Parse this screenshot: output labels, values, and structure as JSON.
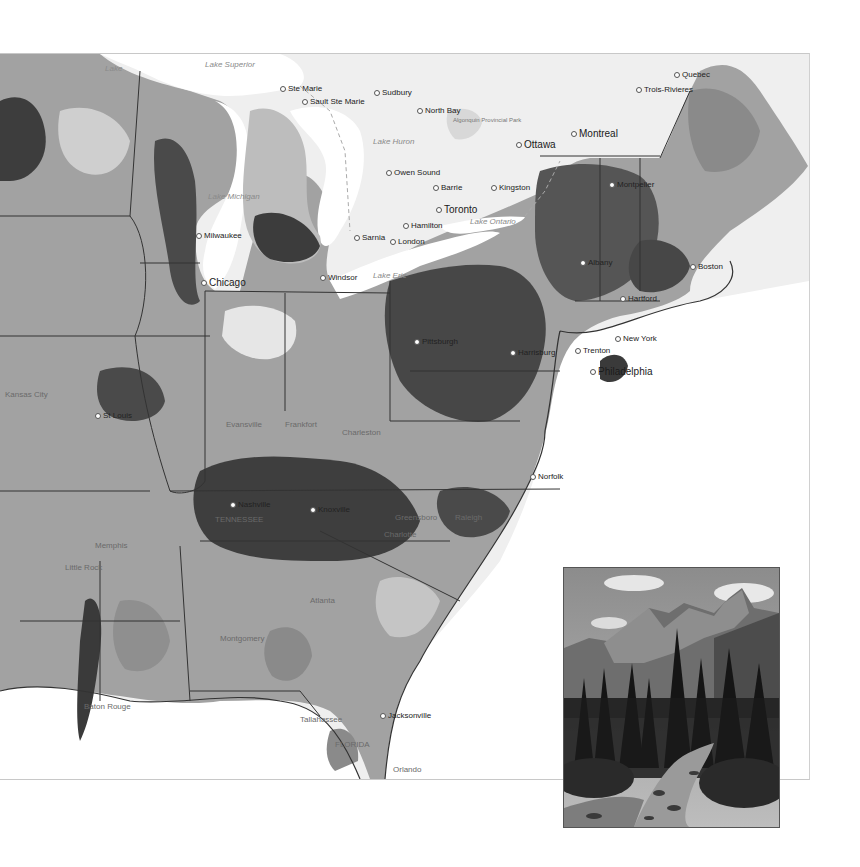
{
  "map": {
    "description": "Grayscale choropleth map of the eastern United States and southern Ontario/Quebec",
    "colors": {
      "water": "#ffffff",
      "canada_land": "#efefef",
      "light": "#c8c8c8",
      "medium": "#9a9a9a",
      "dark": "#5a5a5a",
      "darkest": "#3a3a3a",
      "border": "#333333"
    },
    "labels": [
      {
        "text": "Lake Superior",
        "x": 205,
        "y": 60,
        "type": "water"
      },
      {
        "text": "Lake",
        "x": 105,
        "y": 64,
        "type": "water"
      },
      {
        "text": "Ste Marie",
        "x": 280,
        "y": 84,
        "type": "city"
      },
      {
        "text": "Sault Ste Marie",
        "x": 302,
        "y": 97,
        "type": "city"
      },
      {
        "text": "Sudbury",
        "x": 374,
        "y": 88,
        "type": "city"
      },
      {
        "text": "North Bay",
        "x": 417,
        "y": 106,
        "type": "city"
      },
      {
        "text": "Algonquin Provincial Park",
        "x": 453,
        "y": 116,
        "type": "park"
      },
      {
        "text": "Lake Huron",
        "x": 373,
        "y": 137,
        "type": "water"
      },
      {
        "text": "Ottawa",
        "x": 516,
        "y": 139,
        "type": "city_big"
      },
      {
        "text": "Montreal",
        "x": 571,
        "y": 128,
        "type": "city_big"
      },
      {
        "text": "Trois-Rivieres",
        "x": 636,
        "y": 85,
        "type": "city"
      },
      {
        "text": "Quebec",
        "x": 674,
        "y": 70,
        "type": "city"
      },
      {
        "text": "Owen Sound",
        "x": 386,
        "y": 168,
        "type": "city"
      },
      {
        "text": "Barrie",
        "x": 433,
        "y": 183,
        "type": "city"
      },
      {
        "text": "Kingston",
        "x": 491,
        "y": 183,
        "type": "city"
      },
      {
        "text": "Toronto",
        "x": 436,
        "y": 204,
        "type": "city_big"
      },
      {
        "text": "Lake Ontario",
        "x": 470,
        "y": 217,
        "type": "water"
      },
      {
        "text": "Hamilton",
        "x": 403,
        "y": 221,
        "type": "city"
      },
      {
        "text": "London",
        "x": 390,
        "y": 237,
        "type": "city"
      },
      {
        "text": "Sarnia",
        "x": 354,
        "y": 233,
        "type": "city"
      },
      {
        "text": "Lake Michigan",
        "x": 208,
        "y": 192,
        "type": "water"
      },
      {
        "text": "Milwaukee",
        "x": 196,
        "y": 231,
        "type": "city"
      },
      {
        "text": "Chicago",
        "x": 201,
        "y": 277,
        "type": "city_big"
      },
      {
        "text": "Lake Erie",
        "x": 373,
        "y": 271,
        "type": "water"
      },
      {
        "text": "Windsor",
        "x": 320,
        "y": 273,
        "type": "city"
      },
      {
        "text": "Montpelier",
        "x": 609,
        "y": 180,
        "type": "city"
      },
      {
        "text": "Albany",
        "x": 580,
        "y": 258,
        "type": "city"
      },
      {
        "text": "Boston",
        "x": 690,
        "y": 262,
        "type": "city"
      },
      {
        "text": "Hartford",
        "x": 620,
        "y": 294,
        "type": "city"
      },
      {
        "text": "New York",
        "x": 615,
        "y": 334,
        "type": "city"
      },
      {
        "text": "Pittsburgh",
        "x": 414,
        "y": 337,
        "type": "city"
      },
      {
        "text": "Harrisburg",
        "x": 510,
        "y": 348,
        "type": "city"
      },
      {
        "text": "Trenton",
        "x": 575,
        "y": 346,
        "type": "city"
      },
      {
        "text": "Philadelphia",
        "x": 590,
        "y": 366,
        "type": "city_big"
      },
      {
        "text": "Kansas City",
        "x": 5,
        "y": 390,
        "type": "faint"
      },
      {
        "text": "St Louis",
        "x": 95,
        "y": 411,
        "type": "city"
      },
      {
        "text": "Evansville",
        "x": 226,
        "y": 420,
        "type": "faint"
      },
      {
        "text": "Frankfort",
        "x": 285,
        "y": 420,
        "type": "faint"
      },
      {
        "text": "Charleston",
        "x": 342,
        "y": 428,
        "type": "faint"
      },
      {
        "text": "Norfolk",
        "x": 530,
        "y": 472,
        "type": "city"
      },
      {
        "text": "Nashville",
        "x": 230,
        "y": 500,
        "type": "city"
      },
      {
        "text": "TENNESSEE",
        "x": 215,
        "y": 515,
        "type": "faint"
      },
      {
        "text": "Knoxville",
        "x": 310,
        "y": 505,
        "type": "city"
      },
      {
        "text": "Greensboro",
        "x": 395,
        "y": 513,
        "type": "faint"
      },
      {
        "text": "Raleigh",
        "x": 455,
        "y": 513,
        "type": "faint"
      },
      {
        "text": "Charlotte",
        "x": 384,
        "y": 530,
        "type": "faint"
      },
      {
        "text": "Memphis",
        "x": 95,
        "y": 541,
        "type": "faint"
      },
      {
        "text": "Little Rock",
        "x": 65,
        "y": 563,
        "type": "faint"
      },
      {
        "text": "Atlanta",
        "x": 310,
        "y": 596,
        "type": "faint"
      },
      {
        "text": "Montgomery",
        "x": 220,
        "y": 634,
        "type": "faint"
      },
      {
        "text": "Baton Rouge",
        "x": 84,
        "y": 702,
        "type": "faint"
      },
      {
        "text": "Tallahassee",
        "x": 300,
        "y": 715,
        "type": "faint"
      },
      {
        "text": "Jacksonville",
        "x": 380,
        "y": 711,
        "type": "city"
      },
      {
        "text": "FLORIDA",
        "x": 335,
        "y": 740,
        "type": "faint"
      },
      {
        "text": "Orlando",
        "x": 393,
        "y": 765,
        "type": "faint"
      }
    ],
    "attribution": "Esri, HERE"
  },
  "inset_photo": {
    "description": "Black-and-white photograph of jagged mountain peaks above a conifer forest and a rocky stream",
    "subject": "mountain stream"
  }
}
